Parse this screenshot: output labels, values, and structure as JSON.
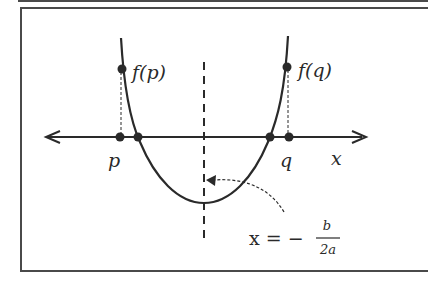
{
  "diagram": {
    "colors": {
      "stroke": "#2a2a2a",
      "frame": "#4a4a4a",
      "background": "#ffffff"
    },
    "labels": {
      "f_p": "f(p)",
      "f_q": "f(q)",
      "p": "p",
      "q": "q",
      "x_axis": "x",
      "axis_eq_lhs": "x = −",
      "axis_eq_num": "b",
      "axis_eq_den": "2a"
    },
    "points": [
      {
        "name": "f(p)",
        "x": 122,
        "y": 69
      },
      {
        "name": "f(q)",
        "x": 287,
        "y": 67
      },
      {
        "name": "p",
        "x": 120,
        "y": 137
      },
      {
        "name": "left-root",
        "x": 138,
        "y": 137
      },
      {
        "name": "right-root",
        "x": 270,
        "y": 137
      },
      {
        "name": "q",
        "x": 289,
        "y": 137
      }
    ],
    "vertex": {
      "x": 204,
      "y": 203
    }
  }
}
